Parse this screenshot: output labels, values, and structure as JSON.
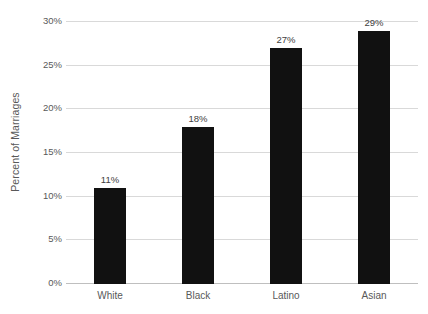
{
  "chart_data": {
    "type": "bar",
    "title": "",
    "subtitle": "",
    "xlabel": "",
    "ylabel": "Percent of Marriages",
    "categories": [
      "White",
      "Black",
      "Latino",
      "Asian"
    ],
    "values": [
      11,
      18,
      27,
      29
    ],
    "value_labels": [
      "11%",
      "18%",
      "27%",
      "29%"
    ],
    "ylim": [
      0,
      30
    ],
    "ytick_values": [
      0,
      5,
      10,
      15,
      20,
      25,
      30
    ],
    "ytick_labels": [
      "0%",
      "5%",
      "10%",
      "15%",
      "20%",
      "25%",
      "30%"
    ],
    "grid": true,
    "grid_axis": "y",
    "legend": false,
    "legend_position": "none",
    "bar_color": "#111111",
    "gridline_color": "#d9d9d9",
    "axis_line_color": "#bfbfbf",
    "text_color": "#595959",
    "background_color": "#ffffff"
  },
  "yticks": {
    "t0": "0%",
    "t1": "5%",
    "t2": "10%",
    "t3": "15%",
    "t4": "20%",
    "t5": "25%",
    "t6": "30%"
  },
  "bars": {
    "b0": {
      "label": "White",
      "value_label": "11%"
    },
    "b1": {
      "label": "Black",
      "value_label": "18%"
    },
    "b2": {
      "label": "Latino",
      "value_label": "27%"
    },
    "b3": {
      "label": "Asian",
      "value_label": "29%"
    }
  },
  "axis": {
    "y_title": "Percent of Marriages"
  }
}
